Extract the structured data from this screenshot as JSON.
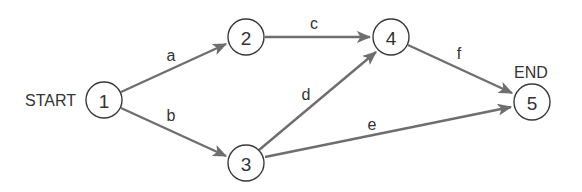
{
  "diagram": {
    "type": "activity-on-arrow network",
    "start_label": "START",
    "end_label": "END",
    "nodes": [
      {
        "id": "1",
        "label": "1",
        "x": 104,
        "y": 100
      },
      {
        "id": "2",
        "label": "2",
        "x": 246,
        "y": 37
      },
      {
        "id": "3",
        "label": "3",
        "x": 246,
        "y": 163
      },
      {
        "id": "4",
        "label": "4",
        "x": 391,
        "y": 37
      },
      {
        "id": "5",
        "label": "5",
        "x": 532,
        "y": 102
      }
    ],
    "edges": [
      {
        "label": "a",
        "from": "1",
        "to": "2"
      },
      {
        "label": "b",
        "from": "1",
        "to": "3"
      },
      {
        "label": "c",
        "from": "2",
        "to": "4"
      },
      {
        "label": "d",
        "from": "3",
        "to": "4"
      },
      {
        "label": "e",
        "from": "3",
        "to": "5"
      },
      {
        "label": "f",
        "from": "4",
        "to": "5"
      }
    ],
    "colors": {
      "edge": "#6e6e6e",
      "node_stroke": "#3a3a3a",
      "text": "#333333"
    }
  }
}
